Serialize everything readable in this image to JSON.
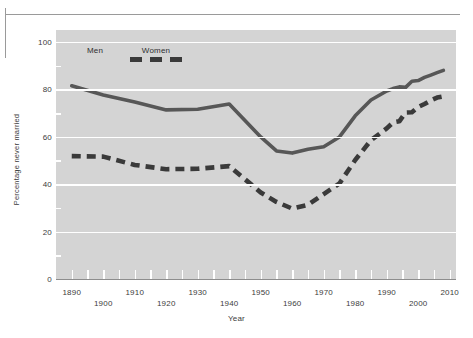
{
  "figure": {
    "frame_color": "#9a9a9a",
    "plot_background": "#d4d4d4",
    "gridline_color": "#ffffff"
  },
  "legend": {
    "position": "top-left-inside",
    "entries": [
      {
        "label": "Men",
        "style": "solid",
        "color": "#575757"
      },
      {
        "label": "Women",
        "style": "dashed",
        "color": "#3a3a3a"
      }
    ]
  },
  "axes": {
    "y": {
      "title": "Percentage never married",
      "ticks": [
        0,
        20,
        40,
        60,
        80,
        100
      ],
      "minor_ticks": [
        10,
        30,
        50,
        70,
        90
      ],
      "range": [
        0,
        105
      ]
    },
    "x": {
      "title": "Year",
      "ticks_row_a": [
        1890,
        1910,
        1930,
        1950,
        1970,
        1990,
        2010
      ],
      "ticks_row_b": [
        1900,
        1920,
        1940,
        1960,
        1980,
        2000
      ],
      "minor_ticks": [
        1895,
        1905,
        1915,
        1925,
        1935,
        1945,
        1955,
        1965,
        1975,
        1985,
        1995,
        2005
      ],
      "range": [
        1885,
        2012
      ]
    }
  },
  "chart_data": {
    "type": "line",
    "title": "",
    "xlabel": "Year",
    "ylabel": "Percentage never married",
    "xlim": [
      1885,
      2012
    ],
    "ylim": [
      0,
      105
    ],
    "grid": true,
    "legend_position": "upper left",
    "series": [
      {
        "name": "Men",
        "style": "solid",
        "color": "#575757",
        "x": [
          1890,
          1900,
          1910,
          1920,
          1930,
          1940,
          1950,
          1955,
          1960,
          1965,
          1970,
          1975,
          1980,
          1985,
          1990,
          1992,
          1994,
          1996,
          1998,
          2000,
          2002,
          2004,
          2006,
          2008
        ],
        "y": [
          81.5,
          77.6,
          74.6,
          71.3,
          71.6,
          73.8,
          59.9,
          54.0,
          53.1,
          54.7,
          55.8,
          59.9,
          68.8,
          75.5,
          79.3,
          80.3,
          81.0,
          80.8,
          83.4,
          83.7,
          85.0,
          86.0,
          87.0,
          88.0
        ]
      },
      {
        "name": "Women",
        "style": "dashed",
        "color": "#3a3a3a",
        "x": [
          1890,
          1900,
          1910,
          1920,
          1930,
          1940,
          1950,
          1955,
          1960,
          1965,
          1970,
          1975,
          1980,
          1985,
          1990,
          1992,
          1994,
          1996,
          1998,
          2000,
          2002,
          2004,
          2006,
          2008
        ],
        "y": [
          51.8,
          51.6,
          48.1,
          46.3,
          46.5,
          47.6,
          36.5,
          32.5,
          29.7,
          31.3,
          35.8,
          40.3,
          50.2,
          58.5,
          63.5,
          66.0,
          66.5,
          70.2,
          70.3,
          72.5,
          73.8,
          75.3,
          76.5,
          77.0
        ]
      }
    ]
  }
}
